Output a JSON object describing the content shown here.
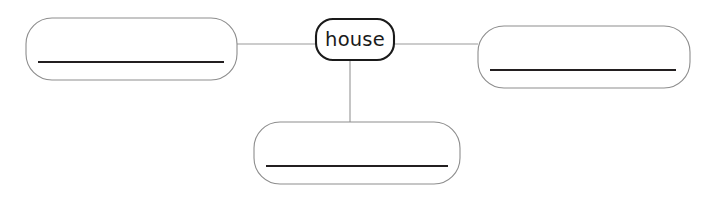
{
  "diagram": {
    "type": "concept-map",
    "title_text": "house",
    "canvas": {
      "width": 715,
      "height": 200,
      "background": "#ffffff"
    },
    "colors": {
      "center_border": "#1a1a1a",
      "blank_border": "#8d8d8d",
      "writeon_line": "#231f20",
      "connector": "#9a9a9a",
      "node_fill": "#ffffff",
      "label_text": "#1a1a1a"
    },
    "center_node": {
      "label": "house",
      "x": 316,
      "y": 19,
      "width": 78,
      "height": 41,
      "radius": 17
    },
    "blank_nodes": [
      {
        "position": "left",
        "label": "",
        "x": 26,
        "y": 18,
        "width": 211,
        "height": 62,
        "radius": 26,
        "line_x1": 38,
        "line_x2": 224,
        "line_y": 62
      },
      {
        "position": "right",
        "label": "",
        "x": 478,
        "y": 26,
        "width": 212,
        "height": 62,
        "radius": 26,
        "line_x1": 490,
        "line_x2": 676,
        "line_y": 70
      },
      {
        "position": "bottom",
        "label": "",
        "x": 254,
        "y": 122,
        "width": 206,
        "height": 62,
        "radius": 26,
        "line_x1": 266,
        "line_x2": 448,
        "line_y": 166
      }
    ],
    "connectors": [
      {
        "name": "left-to-center",
        "x1": 237,
        "y1": 44,
        "x2": 316,
        "y2": 44
      },
      {
        "name": "center-to-right",
        "x1": 394,
        "y1": 44,
        "x2": 478,
        "y2": 44
      },
      {
        "name": "center-to-bottom",
        "x1": 350,
        "y1": 60,
        "x2": 350,
        "y2": 122
      }
    ]
  }
}
